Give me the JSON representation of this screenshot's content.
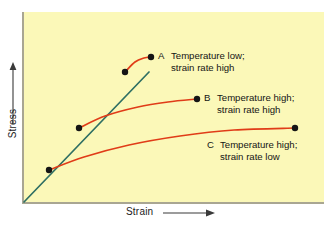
{
  "figure": {
    "background_color": "#ffffff",
    "plot_background_color": "#fbf8b8",
    "axis_color": "#a9a692"
  },
  "axes": {
    "y_title": "Stress",
    "x_title": "Strain",
    "y_arrow_icon": "up-arrow-icon",
    "x_arrow_icon": "right-arrow-icon"
  },
  "annotations": [
    {
      "key": "A",
      "line1": "Temperature low;",
      "line2": "strain rate high"
    },
    {
      "key": "B",
      "line1": "Temperature high;",
      "line2": "strain rate high"
    },
    {
      "key": "C",
      "line1": "Temperature high;",
      "line2": "strain rate low"
    }
  ],
  "chart_data": {
    "type": "line",
    "title": "",
    "xlabel": "Strain",
    "ylabel": "Stress",
    "xlim": [
      0,
      1
    ],
    "ylim": [
      0,
      1
    ],
    "grid": false,
    "legend": "inline-annotations",
    "axis_ticks": [],
    "colors": {
      "elastic_line": "#2e6f63",
      "plastic_curves": "#e03c18",
      "markers": "#151515"
    },
    "series": [
      {
        "name": "elastic-loading",
        "color": "#2e6f63",
        "style": "straight",
        "points": [
          {
            "x": 0.0,
            "y": 0.0
          },
          {
            "x": 0.4167,
            "y": 0.6842
          }
        ]
      },
      {
        "name": "A",
        "label": "Temperature low; strain rate high",
        "color": "#e03c18",
        "yield_point": {
          "x": 0.3367,
          "y": 0.6842
        },
        "end_point": {
          "x": 0.4233,
          "y": 0.7632
        },
        "points": [
          {
            "x": 0.3367,
            "y": 0.6842
          },
          {
            "x": 0.37,
            "y": 0.7368
          },
          {
            "x": 0.4,
            "y": 0.7579
          },
          {
            "x": 0.4233,
            "y": 0.7632
          }
        ]
      },
      {
        "name": "B",
        "label": "Temperature high; strain rate high",
        "color": "#e03c18",
        "yield_point": {
          "x": 0.1833,
          "y": 0.3895
        },
        "end_point": {
          "x": 0.5767,
          "y": 0.5421
        },
        "points": [
          {
            "x": 0.1833,
            "y": 0.3895
          },
          {
            "x": 0.27,
            "y": 0.4526
          },
          {
            "x": 0.38,
            "y": 0.5
          },
          {
            "x": 0.48,
            "y": 0.5263
          },
          {
            "x": 0.5767,
            "y": 0.5421
          }
        ]
      },
      {
        "name": "C",
        "label": "Temperature high; strain rate low",
        "color": "#e03c18",
        "yield_point": {
          "x": 0.0833,
          "y": 0.1684
        },
        "end_point": {
          "x": 0.9033,
          "y": 0.3895
        },
        "points": [
          {
            "x": 0.0833,
            "y": 0.1684
          },
          {
            "x": 0.2,
            "y": 0.2368
          },
          {
            "x": 0.35,
            "y": 0.3
          },
          {
            "x": 0.52,
            "y": 0.3474
          },
          {
            "x": 0.7,
            "y": 0.3789
          },
          {
            "x": 0.9033,
            "y": 0.3895
          }
        ]
      }
    ],
    "markers": [
      {
        "label": "A-yield",
        "x": 0.3367,
        "y": 0.6842
      },
      {
        "label": "A-end",
        "x": 0.4233,
        "y": 0.7632
      },
      {
        "label": "B-yield",
        "x": 0.1833,
        "y": 0.3895
      },
      {
        "label": "B-end",
        "x": 0.5767,
        "y": 0.5421
      },
      {
        "label": "C-yield",
        "x": 0.0833,
        "y": 0.1684
      },
      {
        "label": "C-end",
        "x": 0.9033,
        "y": 0.3895
      }
    ]
  }
}
